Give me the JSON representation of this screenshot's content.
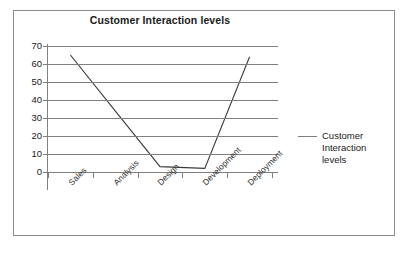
{
  "chart_data": {
    "type": "line",
    "title": "Customer Interaction levels",
    "xlabel": "",
    "ylabel": "",
    "categories": [
      "Sales",
      "Analysis",
      "Design",
      "Development",
      "Deployment"
    ],
    "series": [
      {
        "name": "Customer Interaction levels",
        "values": [
          65,
          34,
          3,
          2,
          64
        ],
        "color": "#3a3a3a"
      }
    ],
    "ylim": [
      0,
      70
    ],
    "ytick_step": 10,
    "yticks": [
      70,
      60,
      50,
      40,
      30,
      20,
      10,
      0
    ],
    "grid": true,
    "gridline_color": "#808080",
    "legend_position": "right",
    "legend_entries": [
      "Customer Interaction levels"
    ],
    "plot_border": "left-bottom-only",
    "xtick_label_rotation": -45
  },
  "legend": {
    "line1": "Customer",
    "line2": "Interaction levels"
  },
  "colors": {
    "frame": "#8c8c8c",
    "grid": "#808080",
    "series": "#3a3a3a",
    "text": "#1a1a1a",
    "background": "#ffffff"
  }
}
